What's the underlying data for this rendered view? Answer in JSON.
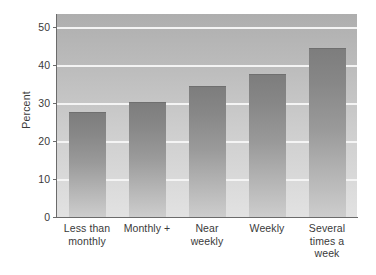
{
  "chart_data": {
    "type": "bar",
    "title": "",
    "subtitle": "",
    "xlabel": "",
    "ylabel": "Percent",
    "categories": [
      "Less than monthly",
      "Monthly +",
      "Near weekly",
      "Weekly",
      "Several times a week"
    ],
    "values": [
      27.6,
      30.2,
      34.4,
      37.8,
      44.6
    ],
    "ylim": [
      0,
      53.5
    ],
    "yticks": [
      0,
      10,
      20,
      30,
      40,
      50
    ],
    "ytick_labels": [
      "0",
      "10",
      "20",
      "30",
      "40",
      "50"
    ],
    "grid": true,
    "grid_axis": "y",
    "legend": false,
    "legend_position": "none",
    "bar_color": "#8c8c8c",
    "plot_background": "#c2c2c2",
    "gridline_color": "#f4f4f4",
    "axis_color": "#6b6b6b",
    "text_color": "#3a3a3a"
  },
  "axis": {
    "y_title": "Percent",
    "ticks": [
      {
        "label": "50",
        "value": 50
      },
      {
        "label": "40",
        "value": 40
      },
      {
        "label": "30",
        "value": 30
      },
      {
        "label": "20",
        "value": 20
      },
      {
        "label": "10",
        "value": 10
      },
      {
        "label": "0",
        "value": 0
      }
    ]
  },
  "bars": [
    {
      "label_line1": "Less than",
      "label_line2": "monthly",
      "label_line3": "",
      "value": 27.6
    },
    {
      "label_line1": "Monthly +",
      "label_line2": "",
      "label_line3": "",
      "value": 30.2
    },
    {
      "label_line1": "Near",
      "label_line2": "weekly",
      "label_line3": "",
      "value": 34.4
    },
    {
      "label_line1": "Weekly",
      "label_line2": "",
      "label_line3": "",
      "value": 37.8
    },
    {
      "label_line1": "Several",
      "label_line2": "times a",
      "label_line3": "week",
      "value": 44.6
    }
  ]
}
